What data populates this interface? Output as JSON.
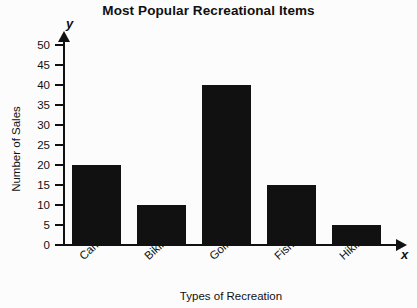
{
  "chart_data": {
    "type": "bar",
    "title": "Most Popular Recreational Items",
    "xlabel": "Types of Recreation",
    "ylabel": "Number of Sales",
    "categories": [
      "Camping",
      "Biking",
      "Golfing",
      "Fishing",
      "Hiking"
    ],
    "values": [
      20,
      10,
      40,
      15,
      5
    ],
    "ylim": [
      0,
      50
    ],
    "ytick_step": 5,
    "yticks": [
      0,
      5,
      10,
      15,
      20,
      25,
      30,
      35,
      40,
      45,
      50
    ],
    "ytick_labels": [
      "0",
      "5",
      "10",
      "15",
      "20",
      "25",
      "30",
      "35",
      "40",
      "45",
      "50"
    ],
    "grid": false,
    "legend": false,
    "legend_position": "none",
    "axis_letters": {
      "x": "x",
      "y": "y"
    },
    "bar_color": "#111111",
    "background_color": "#fcfcfc",
    "series": [
      {
        "name": "Number of Sales",
        "values": [
          20,
          10,
          40,
          15,
          5
        ]
      }
    ]
  }
}
